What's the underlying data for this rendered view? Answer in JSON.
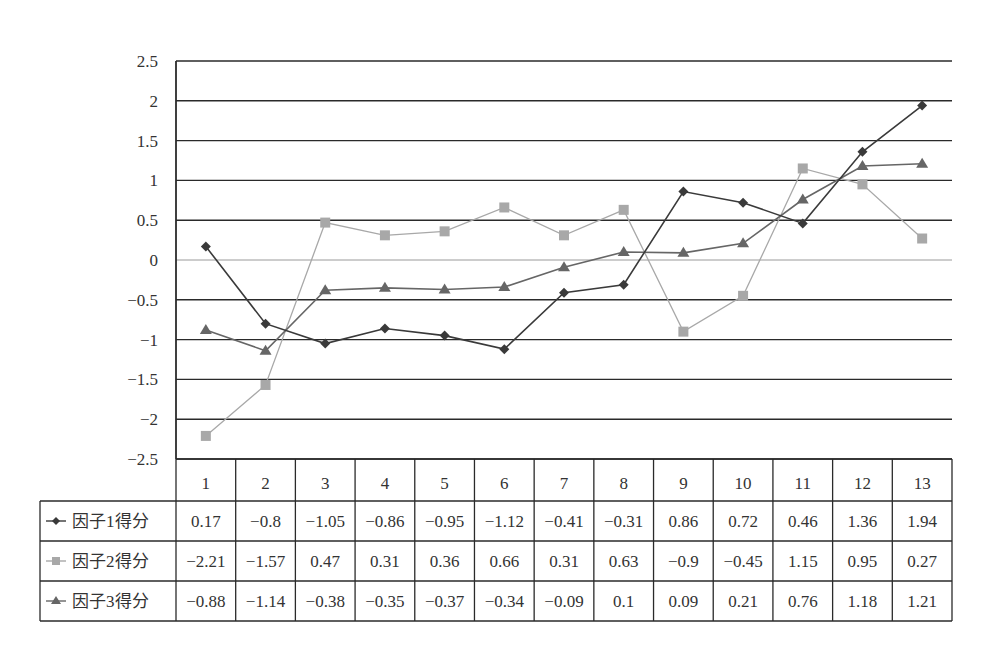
{
  "chart_data": {
    "type": "line",
    "title": "",
    "xlabel": "",
    "ylabel": "",
    "categories": [
      "1",
      "2",
      "3",
      "4",
      "5",
      "6",
      "7",
      "8",
      "9",
      "10",
      "11",
      "12",
      "13"
    ],
    "series": [
      {
        "name": "因子1得分",
        "marker": "diamond",
        "color": "#3a3a3a",
        "values": [
          0.17,
          -0.8,
          -1.05,
          -0.86,
          -0.95,
          -1.12,
          -0.41,
          -0.31,
          0.86,
          0.72,
          0.46,
          1.36,
          1.94
        ]
      },
      {
        "name": "因子2得分",
        "marker": "square",
        "color": "#a8a8a8",
        "values": [
          -2.21,
          -1.57,
          0.47,
          0.31,
          0.36,
          0.66,
          0.31,
          0.63,
          -0.9,
          -0.45,
          1.15,
          0.95,
          0.27
        ]
      },
      {
        "name": "因子3得分",
        "marker": "triangle",
        "color": "#666666",
        "values": [
          -0.88,
          -1.14,
          -0.38,
          -0.35,
          -0.37,
          -0.34,
          -0.09,
          0.1,
          0.09,
          0.21,
          0.76,
          1.18,
          1.21
        ]
      }
    ],
    "yticks": [
      "2.5",
      "2",
      "1.5",
      "1",
      "0.5",
      "0",
      "−0.5",
      "−1",
      "−1.5",
      "−2",
      "−2.5"
    ],
    "ylim": [
      -2.5,
      2.5
    ],
    "grid": true,
    "legend_position": "data-table-left",
    "data_table": true
  }
}
